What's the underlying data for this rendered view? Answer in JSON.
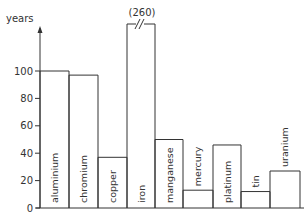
{
  "chart_data": {
    "type": "bar",
    "title": "",
    "xlabel": "",
    "ylabel": "years",
    "ylim": [
      0,
      120
    ],
    "yticks": [
      0,
      20,
      40,
      60,
      80,
      100
    ],
    "grid": false,
    "legend": null,
    "categories": [
      "aluminium",
      "chromium",
      "copper",
      "iron",
      "manganese",
      "mercury",
      "platinum",
      "tin",
      "uranium"
    ],
    "values": [
      100,
      97,
      37,
      260,
      50,
      13,
      46,
      12,
      27
    ],
    "annotations": [
      {
        "category": "iron",
        "text": "(260)",
        "note": "axis break; bar truncated"
      }
    ]
  },
  "axis": {
    "ylabel": "years",
    "ticks": [
      "0",
      "20",
      "40",
      "60",
      "80",
      "100"
    ]
  },
  "iron_annotation": "(260)"
}
